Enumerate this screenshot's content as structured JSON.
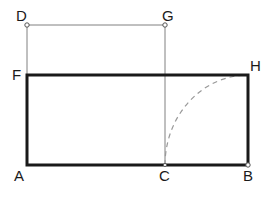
{
  "canvas": {
    "width": 270,
    "height": 199,
    "background": "#ffffff"
  },
  "colors": {
    "thick_stroke": "#1a1a1a",
    "thin_stroke": "#808080",
    "dashed_arc": "#999999",
    "label_text": "#1a1a1a",
    "marker_fill": "#ffffff",
    "marker_stroke": "#555555"
  },
  "labels": {
    "a": "A",
    "b": "B",
    "c": "C",
    "d": "D",
    "f": "F",
    "g": "G",
    "h": "H"
  },
  "points": {
    "A": {
      "x": 27,
      "y": 165
    },
    "B": {
      "x": 248,
      "y": 165
    },
    "C": {
      "x": 165,
      "y": 165
    },
    "D": {
      "x": 27,
      "y": 25
    },
    "F": {
      "x": 27,
      "y": 75
    },
    "G": {
      "x": 165,
      "y": 25
    },
    "H": {
      "x": 248,
      "y": 75
    }
  },
  "label_positions": {
    "A": {
      "x": 14,
      "y": 181
    },
    "B": {
      "x": 243,
      "y": 181
    },
    "C": {
      "x": 159,
      "y": 181
    },
    "D": {
      "x": 16,
      "y": 21
    },
    "F": {
      "x": 12,
      "y": 80
    },
    "G": {
      "x": 162,
      "y": 21
    },
    "H": {
      "x": 250,
      "y": 71
    }
  },
  "shapes": {
    "main_rectangle": {
      "name": "ABHF",
      "path": "M 27 165 L 248 165 L 248 75 L 27 75 Z",
      "stroke_width": 3
    },
    "upper_horizontal_DG": {
      "path": "M 27 25 L 165 25",
      "stroke_width": 1
    },
    "left_vertical_DF": {
      "path": "M 27 25 L 27 75",
      "stroke_width": 1
    },
    "mid_vertical_GC": {
      "path": "M 165 25 L 165 165",
      "stroke_width": 1
    },
    "dashed_arc_CH": {
      "path": "M 165 165 A 83 90 0 0 1 248 75",
      "stroke_width": 1.2,
      "dash_pattern": "5 4"
    }
  },
  "markers": [
    {
      "id": "marker-D",
      "x": 27,
      "y": 25,
      "r": 2.2
    },
    {
      "id": "marker-G",
      "x": 165,
      "y": 25,
      "r": 2.2
    },
    {
      "id": "marker-B",
      "x": 248,
      "y": 165,
      "r": 2.2
    },
    {
      "id": "marker-C",
      "x": 165,
      "y": 165,
      "r": 1.6
    }
  ]
}
